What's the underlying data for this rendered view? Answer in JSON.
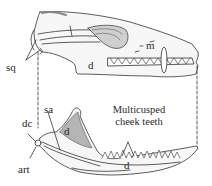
{
  "figure": {
    "labels": {
      "sq": "sq",
      "d_upper": "d",
      "m": "m",
      "dc": "dc",
      "sa": "sa",
      "d_coronoid": "d",
      "d_lower": "d",
      "art": "art",
      "teeth_line1": "Multicusped",
      "teeth_line2": "cheek teeth"
    },
    "colors": {
      "ink": "#333333",
      "shade": "#9a9a9a",
      "bone_fill": "#f7f7f7"
    }
  }
}
